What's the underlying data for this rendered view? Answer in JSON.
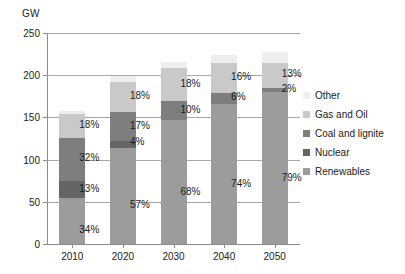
{
  "chart_data": {
    "type": "bar",
    "stacked": true,
    "stack_mode": "absolute",
    "title": "",
    "subtitle": "",
    "xlabel": "",
    "ylabel": "GW",
    "ylim": [
      0,
      250
    ],
    "ytick_values": [
      0,
      50,
      100,
      150,
      200,
      250
    ],
    "ytick_labels": [
      "0",
      "50",
      "100",
      "150",
      "200",
      "250"
    ],
    "grid": true,
    "legend_position": "right",
    "categories": [
      "2010",
      "2020",
      "2030",
      "2040",
      "2050"
    ],
    "totals_gw": [
      158,
      199,
      216,
      224,
      228
    ],
    "series": [
      {
        "name": "Renewables",
        "color": "#9c9c9c",
        "values": [
          54,
          114,
          147,
          166,
          180
        ],
        "percent_labels": [
          "34%",
          "57%",
          "68%",
          "74%",
          "79%"
        ]
      },
      {
        "name": "Nuclear",
        "color": "#656565",
        "values": [
          21,
          8,
          0,
          0,
          0
        ],
        "percent_labels": [
          "13%",
          "4%",
          "",
          "",
          ""
        ]
      },
      {
        "name": "Coal and lignite",
        "color": "#7e7e7e",
        "values": [
          51,
          34,
          22,
          13,
          5
        ],
        "percent_labels": [
          "32%",
          "17%",
          "10%",
          "6%",
          "2%"
        ]
      },
      {
        "name": "Gas and Oil",
        "color": "#c9c9c9",
        "values": [
          28,
          36,
          39,
          36,
          30
        ],
        "percent_labels": [
          "18%",
          "18%",
          "18%",
          "16%",
          "13%"
        ]
      },
      {
        "name": "Other",
        "color": "#eeeeee",
        "values": [
          4,
          7,
          8,
          9,
          13
        ],
        "percent_labels": [
          "",
          "",
          "",
          "",
          ""
        ]
      }
    ],
    "annotations": [
      {
        "category": "2010",
        "text": "18%"
      },
      {
        "category": "2010",
        "text": "32%"
      },
      {
        "category": "2010",
        "text": "13%"
      },
      {
        "category": "2010",
        "text": "34%"
      },
      {
        "category": "2020",
        "text": "18%"
      },
      {
        "category": "2020",
        "text": "17%"
      },
      {
        "category": "2020",
        "text": "4%"
      },
      {
        "category": "2020",
        "text": "57%"
      },
      {
        "category": "2030",
        "text": "18%"
      },
      {
        "category": "2030",
        "text": "10%"
      },
      {
        "category": "2030",
        "text": "68%"
      },
      {
        "category": "2040",
        "text": "16%"
      },
      {
        "category": "2040",
        "text": "6%"
      },
      {
        "category": "2040",
        "text": "74%"
      },
      {
        "category": "2050",
        "text": "13%"
      },
      {
        "category": "2050",
        "text": "2%"
      },
      {
        "category": "2050",
        "text": "79%"
      }
    ]
  },
  "axis": {
    "unit_label": "GW",
    "y_labels": [
      "250",
      "200",
      "150",
      "100",
      "50",
      "0"
    ],
    "x_labels": [
      "2010",
      "2020",
      "2030",
      "2040",
      "2050"
    ]
  },
  "legend": {
    "items": [
      {
        "label": "Other",
        "color": "#eeeeee"
      },
      {
        "label": "Gas and Oil",
        "color": "#c9c9c9"
      },
      {
        "label": "Coal and lignite",
        "color": "#7e7e7e"
      },
      {
        "label": "Nuclear",
        "color": "#656565"
      },
      {
        "label": "Renewables",
        "color": "#9c9c9c"
      }
    ]
  },
  "data_labels": {
    "y2010": [
      "18%",
      "32%",
      "13%",
      "34%"
    ],
    "y2020": [
      "18%",
      "17%",
      "4%",
      "57%"
    ],
    "y2030": [
      "18%",
      "10%",
      "68%"
    ],
    "y2040": [
      "16%",
      "6%",
      "74%"
    ],
    "y2050": [
      "13%",
      "2%",
      "79%"
    ]
  }
}
